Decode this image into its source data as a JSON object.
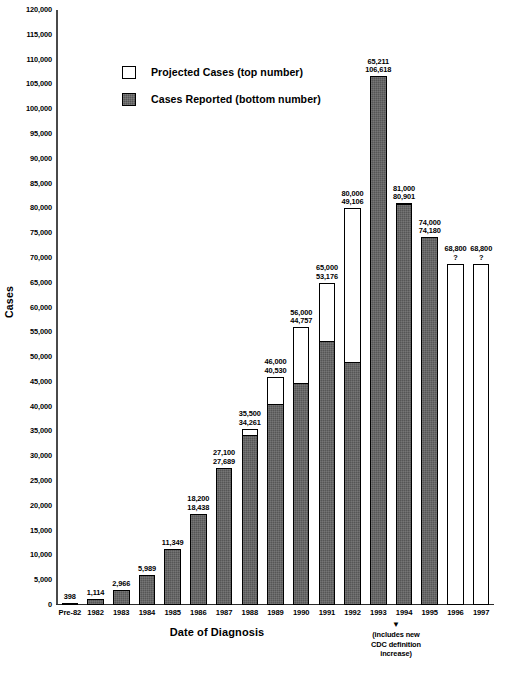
{
  "chart_data": {
    "type": "bar",
    "title": "",
    "xlabel": "Date of Diagnosis",
    "ylabel": "Cases",
    "ylim": [
      0,
      120000
    ],
    "ytick_step": 5000,
    "grid": false,
    "legend_position": "top-center",
    "categories": [
      "Pre-82",
      "1982",
      "1983",
      "1984",
      "1985",
      "1986",
      "1987",
      "1988",
      "1989",
      "1990",
      "1991",
      "1992",
      "1993",
      "1994",
      "1995",
      "1996",
      "1997"
    ],
    "series": [
      {
        "name": "Projected Cases (top number)",
        "values": [
          null,
          null,
          null,
          null,
          null,
          18200,
          27100,
          35500,
          46000,
          56000,
          65000,
          80000,
          65211,
          81000,
          74000,
          68800,
          68800
        ]
      },
      {
        "name": "Cases Reported (bottom number)",
        "values": [
          398,
          1114,
          2966,
          5989,
          11349,
          18438,
          27689,
          34261,
          40530,
          44757,
          53176,
          49106,
          106618,
          80901,
          74180,
          null,
          null
        ]
      }
    ],
    "bar_labels": [
      {
        "category": "Pre-82",
        "top": "",
        "bottom": "398"
      },
      {
        "category": "1982",
        "top": "",
        "bottom": "1,114"
      },
      {
        "category": "1983",
        "top": "",
        "bottom": "2,966"
      },
      {
        "category": "1984",
        "top": "",
        "bottom": "5,989"
      },
      {
        "category": "1985",
        "top": "",
        "bottom": "11,349"
      },
      {
        "category": "1986",
        "top": "18,200",
        "bottom": "18,438"
      },
      {
        "category": "1987",
        "top": "27,100",
        "bottom": "27,689"
      },
      {
        "category": "1988",
        "top": "35,500",
        "bottom": "34,261"
      },
      {
        "category": "1989",
        "top": "46,000",
        "bottom": "40,530"
      },
      {
        "category": "1990",
        "top": "56,000",
        "bottom": "44,757"
      },
      {
        "category": "1991",
        "top": "65,000",
        "bottom": "53,176"
      },
      {
        "category": "1992",
        "top": "80,000",
        "bottom": "49,106"
      },
      {
        "category": "1993",
        "top": "65,211",
        "bottom": "106,618"
      },
      {
        "category": "1994",
        "top": "81,000",
        "bottom": "80,901"
      },
      {
        "category": "1995",
        "top": "74,000",
        "bottom": "74,180"
      },
      {
        "category": "1996",
        "top": "68,800",
        "bottom": "?"
      },
      {
        "category": "1997",
        "top": "68,800",
        "bottom": "?"
      }
    ],
    "ytick_labels": [
      "0",
      "5,000",
      "10,000",
      "15,000",
      "20,000",
      "25,000",
      "30,000",
      "35,000",
      "40,000",
      "45,000",
      "50,000",
      "55,000",
      "60,000",
      "65,000",
      "70,000",
      "75,000",
      "80,000",
      "85,000",
      "90,000",
      "95,000",
      "100,000",
      "105,000",
      "110,000",
      "115,000",
      "120,000"
    ],
    "annotations": [
      {
        "name": "cdc-definition-note",
        "text": "(includes new\nCDC definition\nincrease)",
        "anchor_category": "1993"
      }
    ],
    "colors": {
      "projected_fill": "#ffffff",
      "reported_fill": "#565656",
      "outline": "#000000",
      "axis": "#3d3d3d"
    }
  },
  "legend": {
    "items": [
      {
        "label": "Projected Cases (top number)",
        "swatch": "white"
      },
      {
        "label": "Cases Reported (bottom number)",
        "swatch": "dark"
      }
    ]
  },
  "cdc_note": {
    "line1": "(includes new",
    "line2": "CDC definition",
    "line3": "increase)",
    "arrow": "▼"
  },
  "caption": {
    "text": ""
  },
  "axes": {
    "ylabel": "Cases",
    "xlabel": "Date of Diagnosis"
  }
}
